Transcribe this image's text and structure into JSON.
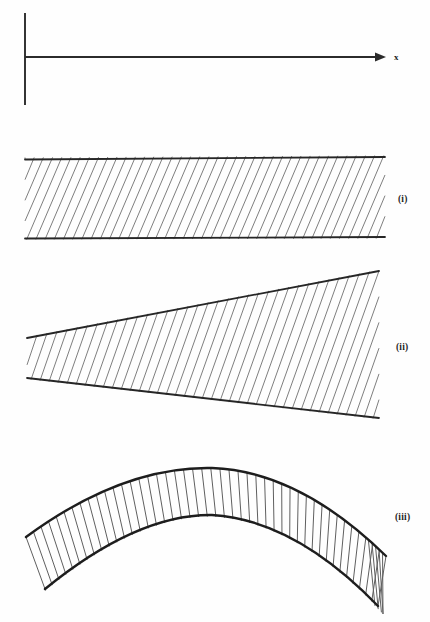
{
  "figure": {
    "background_color": "#fefefe",
    "ink_color": "#262626",
    "hatch_color": "#777777",
    "axis": {
      "x_label": "x",
      "vertical_axis_x": 25,
      "vertical_axis_top": 13,
      "vertical_axis_bottom": 105,
      "horizontal_axis_y": 57,
      "horizontal_axis_start": 25,
      "horizontal_axis_end": 382,
      "arrow_tip_x": 386,
      "label_x": 394,
      "label_y": 60
    },
    "panels": [
      {
        "id": "panel-i",
        "label": "(i)",
        "label_x": 398,
        "label_y": 202,
        "shape": "parallel-band",
        "description": "uniform width hatched band, horizontal top and bottom edges",
        "left_x": 25,
        "right_x": 385,
        "top_left_y": 159,
        "top_right_y": 157,
        "bottom_left_y": 238,
        "bottom_right_y": 237,
        "hatch_angle_deg": 66,
        "hatch_spacing": 9.2,
        "hatch_count": 46
      },
      {
        "id": "panel-ii",
        "label": "(ii)",
        "label_x": 396,
        "label_y": 350,
        "shape": "wedge",
        "description": "tapered wedge widening to the right, straight edges",
        "left_x": 27,
        "right_x": 379,
        "top_left_y": 338,
        "top_right_y": 271,
        "bottom_left_y": 378,
        "bottom_right_y": 418,
        "hatch_angle_deg": 70,
        "hatch_spacing": 9.0,
        "hatch_count": 45
      },
      {
        "id": "panel-iii",
        "label": "(iii)",
        "label_x": 395,
        "label_y": 520,
        "shape": "arch",
        "description": "curved arch shaped band with radial hatching",
        "left_x": 26,
        "right_x": 386,
        "apex_x": 212,
        "outer_apex_y": 468,
        "inner_apex_y": 515,
        "outer_left_y": 537,
        "outer_right_y": 556,
        "inner_left_y": 589,
        "inner_right_y": 606,
        "hatch_count": 44
      }
    ],
    "caption": ""
  }
}
